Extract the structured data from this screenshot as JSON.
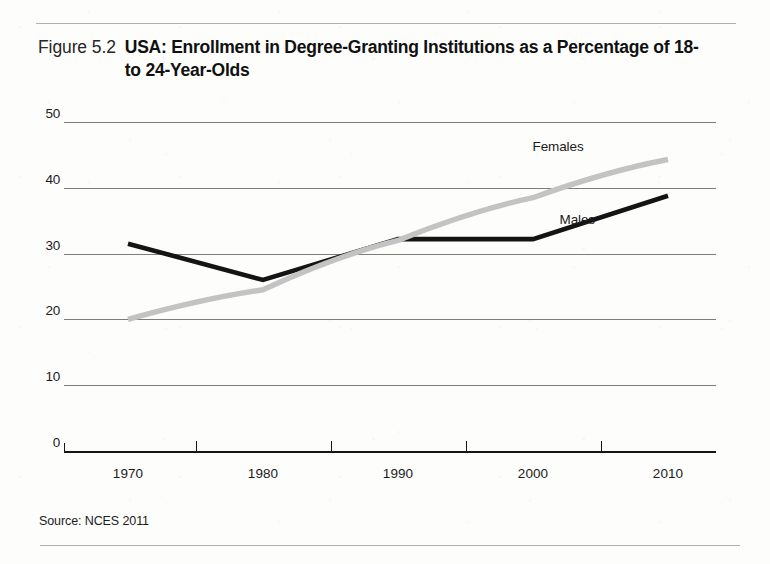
{
  "figure": {
    "number_label": "Figure 5.2",
    "title": "USA: Enrollment in Degree-Granting Institutions as a Percentage of 18- to 24-Year-Olds",
    "source": "Source: NCES 2011"
  },
  "colors": {
    "males_line": "#141414",
    "females_line": "#c3c3c3",
    "gridline": "#7e7d7a",
    "axis": "#151515",
    "text": "#1b1b1b",
    "rule": "#b4b2ae",
    "page_background": "#fdfdfc"
  },
  "chart_data": {
    "type": "line",
    "title": "USA: Enrollment in Degree-Granting Institutions as a Percentage of 18- to 24-Year-Olds",
    "xlabel": "",
    "ylabel": "",
    "x": [
      1970,
      1980,
      1990,
      2000,
      2010
    ],
    "categories": [
      "1970",
      "1980",
      "1990",
      "2000",
      "2010"
    ],
    "xlim": [
      1970,
      2010
    ],
    "ylim": [
      0,
      50
    ],
    "yticks": [
      0,
      10,
      20,
      30,
      40,
      50
    ],
    "ytick_labels": [
      "0",
      "10",
      "20",
      "30",
      "40",
      "50"
    ],
    "xtick_labels": [
      "1970",
      "1980",
      "1990",
      "2000",
      "2010"
    ],
    "grid": "horizontal",
    "legend": "inline-labels-at-line-ends",
    "series": [
      {
        "name": "Males",
        "color": "#141414",
        "values": [
          31.5,
          26.0,
          32.2,
          32.2,
          38.8
        ]
      },
      {
        "name": "Females",
        "color": "#c3c3c3",
        "values": [
          20.0,
          24.5,
          32.0,
          38.5,
          44.3
        ]
      }
    ],
    "annotations": [
      {
        "text": "Females",
        "x": 2001,
        "y": 46.0
      },
      {
        "text": "Males",
        "x": 2003,
        "y": 35.0
      }
    ]
  }
}
